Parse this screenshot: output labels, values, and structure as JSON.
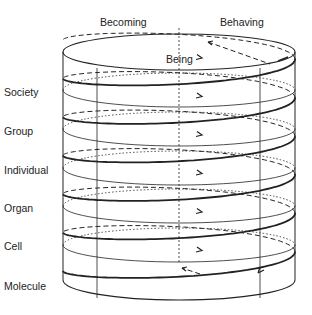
{
  "diagram": {
    "top_labels": [
      {
        "id": "becoming",
        "text": "Becoming",
        "x": 100,
        "y": 16
      },
      {
        "id": "behaving",
        "text": "Behaving",
        "x": 220,
        "y": 16
      },
      {
        "id": "being",
        "text": "Being",
        "x": 166,
        "y": 53
      }
    ],
    "levels": [
      {
        "id": "society",
        "text": "Society",
        "y": 86
      },
      {
        "id": "group",
        "text": "Group",
        "y": 125
      },
      {
        "id": "individual",
        "text": "Individual",
        "y": 164
      },
      {
        "id": "organ",
        "text": "Organ",
        "y": 202
      },
      {
        "id": "cell",
        "text": "Cell",
        "y": 240
      },
      {
        "id": "molecule",
        "text": "Molecule",
        "y": 280
      }
    ],
    "line_color": "#222222"
  }
}
